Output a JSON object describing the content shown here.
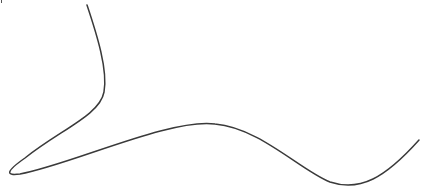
{
  "canvas": {
    "width": 425,
    "height": 194,
    "background": "#ffffff"
  },
  "curve": {
    "stroke": "#3a3a3a",
    "stroke_width": 1.5,
    "path": "M 87 5 C 97 35, 108 70, 104 92 C 100 115, 60 130, 25 158 C 5 172, 6 176, 20 174 C 70 165, 170 118, 215 124 C 260 128, 300 170, 330 182 C 360 192, 385 178, 419 140"
  },
  "edge_mark": {
    "color": "#555555"
  }
}
